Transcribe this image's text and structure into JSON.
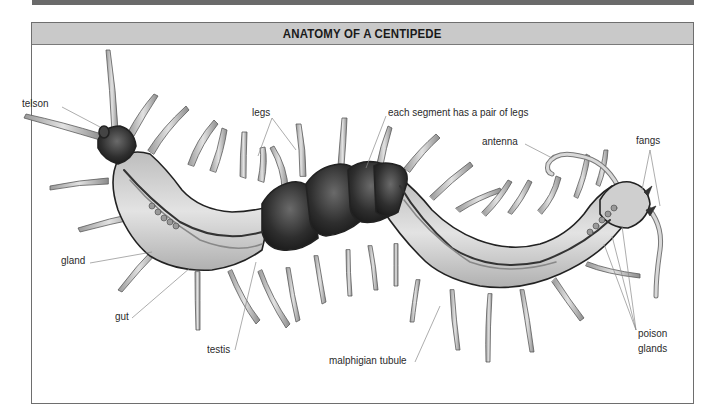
{
  "title": "ANATOMY OF A CENTIPEDE",
  "labels": {
    "telson": "telson",
    "legs": "legs",
    "segment": "each segment has a pair of legs",
    "antenna": "antenna",
    "fangs": "fangs",
    "gland": "gland",
    "gut": "gut",
    "testis": "testis",
    "malphigian": "malphigian tubule",
    "poison1": "poison",
    "poison2": "glands"
  },
  "colors": {
    "frame": "#6e6e6e",
    "title_bg": "#c9c9c9",
    "top_strip": "#6a6a6a",
    "body_light": "#d4d4d4",
    "body_dark": "#2e2e2e",
    "leg": "#c6c6c6",
    "leader_line": "#8a8a8a"
  }
}
